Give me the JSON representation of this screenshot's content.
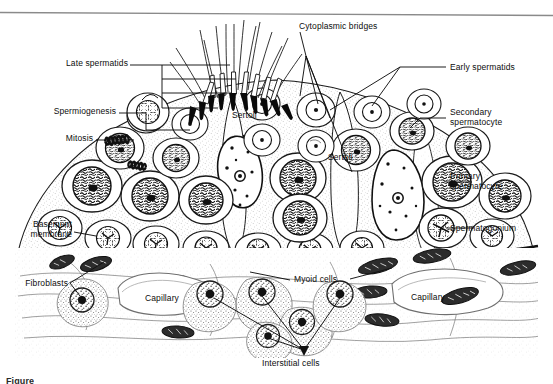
{
  "figure": {
    "kind": "histology-diagram",
    "background_color": "#ffffff",
    "ink_color": "#111111",
    "caption_partial": "Figure"
  },
  "labels": {
    "cytoplasmic_bridges": "Cytoplasmic bridges",
    "late_spermatids": "Late spermatids",
    "spermiogenesis": "Spermiogenesis",
    "mitosis": "Mitosis",
    "basement_membrane_line1": "Basement",
    "basement_membrane_line2": "membrane",
    "fibroblasts": "Fibroblasts",
    "capillary_left": "Capillary",
    "capillary_right": "Capillary",
    "myoid_cells": "Myoid cells",
    "interstitial_cells": "Interstitial cells",
    "early_spermatids": "Early spermatids",
    "secondary_spermatocyte_line1": "Secondary",
    "secondary_spermatocyte_line2": "spermatocyte",
    "primary_spermatocyte_line1": "Primary",
    "primary_spermatocyte_line2": "spermatocyte",
    "spermatogonium": "Spermatogonium",
    "sertoli_left": "Sertoli",
    "sertoli_right": "Sertoli"
  },
  "structures": {
    "spermatozoa_count": 14,
    "germ_cell_layers": [
      "spermatogonium",
      "primary spermatocyte",
      "secondary spermatocyte",
      "early spermatid",
      "late spermatid"
    ],
    "interstitial_tissue": [
      "fibroblasts",
      "capillaries",
      "myoid cells",
      "interstitial cells"
    ]
  }
}
